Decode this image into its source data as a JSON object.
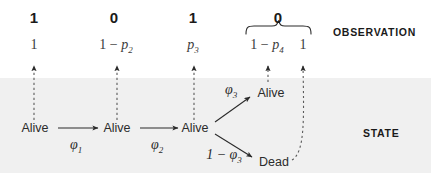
{
  "figure": {
    "band_color": "#f0f0f0",
    "ink_color": "#2b2b2b"
  },
  "row_labels": {
    "observation": "OBSERVATION",
    "state": "STATE"
  },
  "observation_row": {
    "detections": [
      {
        "value": "1",
        "x": 34
      },
      {
        "value": "0",
        "x": 114
      },
      {
        "value": "1",
        "x": 193
      },
      {
        "value": "0",
        "x": 278
      }
    ],
    "probabilities": [
      {
        "text_plain": "1",
        "x": 34
      },
      {
        "text_plain": "1 − p2",
        "x": 116
      },
      {
        "text_plain": "p3",
        "x": 193
      },
      {
        "text_plain": "1 − p4",
        "x": 267
      },
      {
        "text_plain": "1",
        "x": 303
      }
    ],
    "brace": {
      "groups_value": "0",
      "left_x": 245,
      "right_x": 312
    }
  },
  "state_row": {
    "nodes": [
      {
        "label": "Alive",
        "x": 35,
        "y": 128
      },
      {
        "label": "Alive",
        "x": 117,
        "y": 128
      },
      {
        "label": "Alive",
        "x": 195,
        "y": 128
      },
      {
        "label": "Alive",
        "x": 271,
        "y": 89
      },
      {
        "label": "Dead",
        "x": 274,
        "y": 158
      }
    ],
    "transitions": [
      {
        "label_plain": "ϕ1",
        "x": 76,
        "y": 141
      },
      {
        "label_plain": "ϕ2",
        "x": 157,
        "y": 141
      },
      {
        "label_plain": "ϕ3",
        "x": 231,
        "y": 86
      },
      {
        "label_plain": "1 − ϕ3",
        "x": 224,
        "y": 151
      }
    ]
  }
}
